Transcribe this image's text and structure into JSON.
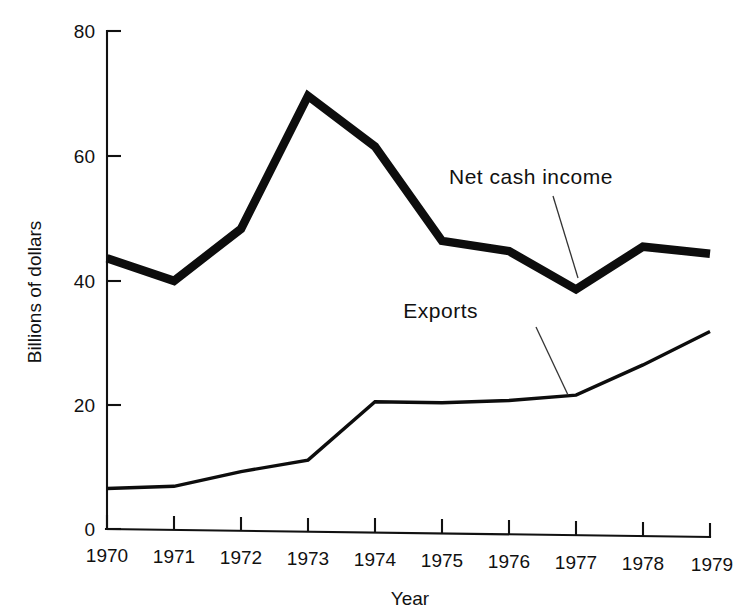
{
  "chart_data": {
    "type": "line",
    "title": "",
    "xlabel": "Year",
    "ylabel": "Billions of dollars",
    "x": [
      1970,
      1971,
      1972,
      1973,
      1974,
      1975,
      1976,
      1977,
      1978,
      1979
    ],
    "categories": [
      "1970",
      "1971",
      "1972",
      "1973",
      "1974",
      "1975",
      "1976",
      "1977",
      "1978",
      "1979"
    ],
    "xlim": [
      1970,
      1979
    ],
    "ylim": [
      0,
      80
    ],
    "yticks": [
      0,
      20,
      40,
      60,
      80
    ],
    "ytick_labels": [
      "0",
      "20",
      "40",
      "60",
      "80"
    ],
    "xticks": [
      1970,
      1971,
      1972,
      1973,
      1974,
      1975,
      1976,
      1977,
      1978,
      1979
    ],
    "grid": false,
    "legend_position": "inline-annotations",
    "series": [
      {
        "name": "Net cash income",
        "style": "thick",
        "color": "#0d0d0d",
        "values": [
          43.5,
          40.0,
          48.5,
          70.0,
          62.0,
          47.0,
          45.5,
          39.5,
          46.5,
          45.5
        ]
      },
      {
        "name": "Exports",
        "style": "thin",
        "color": "#0d0d0d",
        "values": [
          6.5,
          7.0,
          9.5,
          11.5,
          21.0,
          21.0,
          21.5,
          22.5,
          27.5,
          33.0
        ]
      }
    ],
    "annotations": [
      {
        "text": "Net cash income",
        "points_to_year": 1977,
        "points_to_value": 39.5
      },
      {
        "text": "Exports",
        "points_to_year": 1977,
        "points_to_value": 22.5
      }
    ]
  },
  "axes": {
    "y_title": "Billions of dollars",
    "x_title": "Year",
    "y_labels": [
      "80",
      "60",
      "40",
      "20",
      "0"
    ],
    "x_labels": [
      "1970",
      "1971",
      "1972",
      "1973",
      "1974",
      "1975",
      "1976",
      "1977",
      "1978",
      "1979"
    ]
  },
  "labels": {
    "net_cash_income": "Net cash income",
    "exports": "Exports"
  },
  "colors": {
    "ink": "#0d0d0d",
    "background": "#ffffff"
  }
}
